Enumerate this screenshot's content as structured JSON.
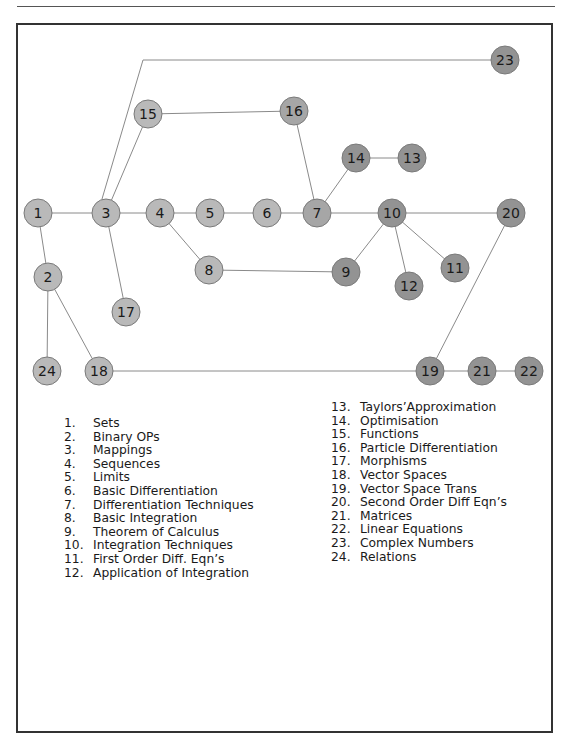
{
  "diagram": {
    "node_radius": 14,
    "colors": {
      "light_node": "#b9b9b9",
      "dark_node": "#939393",
      "node_stroke": "#7a7a7a",
      "edge": "#8a8a8a",
      "frame": "#333333"
    },
    "nodes": [
      {
        "id": "1",
        "x": 38,
        "y": 213,
        "shade": "light"
      },
      {
        "id": "2",
        "x": 48,
        "y": 277,
        "shade": "light"
      },
      {
        "id": "3",
        "x": 106,
        "y": 213,
        "shade": "light"
      },
      {
        "id": "4",
        "x": 160,
        "y": 213,
        "shade": "light"
      },
      {
        "id": "5",
        "x": 210,
        "y": 213,
        "shade": "light"
      },
      {
        "id": "6",
        "x": 267,
        "y": 213,
        "shade": "light"
      },
      {
        "id": "7",
        "x": 317,
        "y": 213,
        "shade": "mid"
      },
      {
        "id": "8",
        "x": 209,
        "y": 270,
        "shade": "light"
      },
      {
        "id": "9",
        "x": 346,
        "y": 272,
        "shade": "dark"
      },
      {
        "id": "10",
        "x": 392,
        "y": 213,
        "shade": "dark"
      },
      {
        "id": "11",
        "x": 455,
        "y": 268,
        "shade": "dark"
      },
      {
        "id": "12",
        "x": 409,
        "y": 286,
        "shade": "dark"
      },
      {
        "id": "13",
        "x": 412,
        "y": 158,
        "shade": "dark"
      },
      {
        "id": "14",
        "x": 356,
        "y": 158,
        "shade": "dark"
      },
      {
        "id": "15",
        "x": 148,
        "y": 114,
        "shade": "light"
      },
      {
        "id": "16",
        "x": 294,
        "y": 111,
        "shade": "mid"
      },
      {
        "id": "17",
        "x": 126,
        "y": 312,
        "shade": "light"
      },
      {
        "id": "18",
        "x": 99,
        "y": 371,
        "shade": "light"
      },
      {
        "id": "19",
        "x": 430,
        "y": 371,
        "shade": "dark"
      },
      {
        "id": "20",
        "x": 511,
        "y": 213,
        "shade": "dark"
      },
      {
        "id": "21",
        "x": 482,
        "y": 371,
        "shade": "dark"
      },
      {
        "id": "22",
        "x": 529,
        "y": 371,
        "shade": "dark"
      },
      {
        "id": "23",
        "x": 505,
        "y": 60,
        "shade": "dark"
      },
      {
        "id": "24",
        "x": 47,
        "y": 371,
        "shade": "light"
      }
    ],
    "edges": [
      [
        "1",
        "3"
      ],
      [
        "3",
        "4"
      ],
      [
        "4",
        "5"
      ],
      [
        "5",
        "6"
      ],
      [
        "6",
        "7"
      ],
      [
        "7",
        "10"
      ],
      [
        "10",
        "20"
      ],
      [
        "1",
        "2"
      ],
      [
        "2",
        "24"
      ],
      [
        "2",
        "18"
      ],
      [
        "18",
        "19"
      ],
      [
        "19",
        "21"
      ],
      [
        "21",
        "22"
      ],
      [
        "19",
        "20"
      ],
      [
        "3",
        "17"
      ],
      [
        "3",
        "15"
      ],
      [
        "15",
        "16"
      ],
      [
        "16",
        "7"
      ],
      [
        "7",
        "14"
      ],
      [
        "14",
        "13"
      ],
      [
        "4",
        "8"
      ],
      [
        "8",
        "9"
      ],
      [
        "9",
        "10"
      ],
      [
        "10",
        "12"
      ],
      [
        "10",
        "11"
      ]
    ],
    "polyline_edges": [
      {
        "from": "3",
        "to": "23",
        "points": [
          [
            102,
            199
          ],
          [
            143,
            60
          ],
          [
            491,
            60
          ]
        ]
      }
    ]
  },
  "legend": {
    "column1": [
      {
        "num": "1.",
        "label": "Sets"
      },
      {
        "num": "2.",
        "label": "Binary OPs"
      },
      {
        "num": "3.",
        "label": "Mappings"
      },
      {
        "num": "4.",
        "label": "Sequences"
      },
      {
        "num": "5.",
        "label": "Limits"
      },
      {
        "num": "6.",
        "label": "Basic Differentiation"
      },
      {
        "num": "7.",
        "label": "Differentiation Techniques"
      },
      {
        "num": "8.",
        "label": "Basic Integration"
      },
      {
        "num": "9.",
        "label": "Theorem of Calculus"
      },
      {
        "num": "10.",
        "label": "Integration Techniques"
      },
      {
        "num": "11.",
        "label": "First Order Diff. Eqn’s"
      },
      {
        "num": "12.",
        "label": "Application of Integration"
      }
    ],
    "column2": [
      {
        "num": "13.",
        "label": "Taylors’Approximation"
      },
      {
        "num": "14.",
        "label": "Optimisation"
      },
      {
        "num": "15.",
        "label": "Functions"
      },
      {
        "num": "16.",
        "label": "Particle Differentiation"
      },
      {
        "num": "17.",
        "label": "Morphisms"
      },
      {
        "num": "18.",
        "label": "Vector Spaces"
      },
      {
        "num": "19.",
        "label": "Vector Space Trans"
      },
      {
        "num": "20.",
        "label": "Second Order Diff Eqn’s"
      },
      {
        "num": "21.",
        "label": "Matrices"
      },
      {
        "num": "22.",
        "label": "Linear Equations"
      },
      {
        "num": "23.",
        "label": "Complex Numbers"
      },
      {
        "num": "24.",
        "label": "Relations"
      }
    ]
  }
}
